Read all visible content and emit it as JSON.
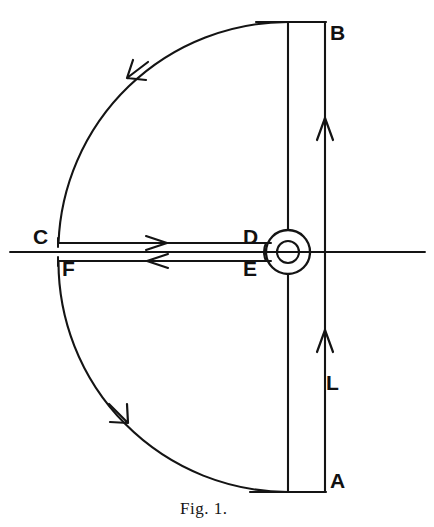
{
  "figure": {
    "caption": "Fig. 1.",
    "title": "Fig. 1.",
    "type": "contour-integration-diagram",
    "canvas": {
      "width": 434,
      "height": 527
    },
    "stroke_color": "#141414",
    "background_color": "#ffffff"
  },
  "labels": {
    "B": "B",
    "A": "A",
    "L": "L",
    "C": "C",
    "D": "D",
    "E": "E",
    "F": "F"
  },
  "geometry": {
    "pole_center": {
      "x": 288,
      "y": 252
    },
    "pole_outer_radius": 22,
    "pole_inner_radius": 11,
    "big_arc_radius": 230,
    "big_arc_center": {
      "x": 288,
      "y": 252
    },
    "inner_vertical_x": 288,
    "outer_vertical_x": 325,
    "top_y": 22,
    "bottom_y": 492,
    "axis_y": 252,
    "axis_x_start": 10,
    "axis_x_end": 425,
    "branch_cut_upper_y": 243,
    "branch_cut_lower_y": 261,
    "branch_cut_x_start": 58,
    "branch_cut_x_end": 270
  },
  "arrows": [
    {
      "name": "upper-arc-arrow",
      "at": {
        "x": 131,
        "y": 76
      },
      "direction": "counterclockwise-down-left"
    },
    {
      "name": "lower-arc-arrow",
      "at": {
        "x": 123,
        "y": 419
      },
      "direction": "clockwise-down-right"
    },
    {
      "name": "upper-branch-cut-arrow",
      "at": {
        "x": 162,
        "y": 243
      },
      "direction": "right"
    },
    {
      "name": "lower-branch-cut-arrow",
      "at": {
        "x": 157,
        "y": 261
      },
      "direction": "left"
    },
    {
      "name": "line-L-upper-arrow",
      "at": {
        "x": 325,
        "y": 122
      },
      "direction": "up"
    },
    {
      "name": "line-L-lower-arrow",
      "at": {
        "x": 325,
        "y": 334
      },
      "direction": "up"
    }
  ]
}
